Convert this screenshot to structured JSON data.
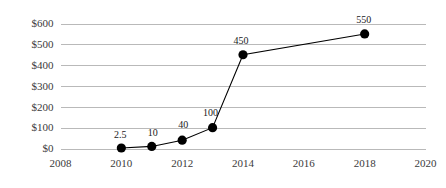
{
  "chart_data": {
    "type": "line",
    "title": "",
    "subtitle": "",
    "xlabel": "",
    "ylabel": "",
    "x": [
      2010,
      2011,
      2012,
      2013,
      2014,
      2018
    ],
    "values": [
      2.5,
      10,
      40,
      100,
      450,
      550
    ],
    "point_labels": [
      "2.5",
      "10",
      "40",
      "100",
      "450",
      "550"
    ],
    "series": [
      {
        "name": "",
        "x": [
          2010,
          2011,
          2012,
          2013,
          2014,
          2018
        ],
        "values": [
          2.5,
          10,
          40,
          100,
          450,
          550
        ]
      }
    ],
    "xlim": [
      2008,
      2020
    ],
    "ylim": [
      0,
      600
    ],
    "xticks": [
      2008,
      2010,
      2012,
      2014,
      2016,
      2018,
      2020
    ],
    "xtick_labels": [
      "2008",
      "2010",
      "2012",
      "2014",
      "2016",
      "2018",
      "2020"
    ],
    "yticks": [
      0,
      100,
      200,
      300,
      400,
      500,
      600
    ],
    "ytick_labels": [
      "$0",
      "$100",
      "$200",
      "$300",
      "$400",
      "$500",
      "$600"
    ],
    "grid": true,
    "grid_axis": "y",
    "legend": false,
    "legend_position": "none",
    "colors": {
      "line": "#000000",
      "marker": "#000000",
      "gridline": "#b9b9b9",
      "tick_text": "#3b3b3b",
      "label_text": "#1a1a1a",
      "background": "#ffffff"
    }
  }
}
